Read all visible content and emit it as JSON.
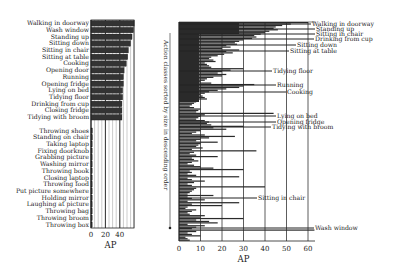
{
  "chart_data": [
    {
      "type": "bar",
      "orientation": "horizontal",
      "title": "",
      "xlabel": "AP",
      "ylabel": "",
      "xlim": [
        0,
        60
      ],
      "xticks": [
        0,
        20,
        40
      ],
      "grid": "vertical",
      "categories": [
        "Walking in doorway",
        "Wash window",
        "Standing up",
        "Sitting down",
        "Sitting in chair",
        "Sitting at table",
        "Cooking",
        "Opening door",
        "Running",
        "Opening fridge",
        "Lying on bed",
        "Tidying floor",
        "Drinking from cup",
        "Closing fridge",
        "Tidying with broom",
        "",
        "Throwing shoes",
        "Standing on chair",
        "Taking laptop",
        "Fixing doorknob",
        "Grabbing picture",
        "Washing mirror",
        "Throwing book",
        "Closing laptop",
        "Throwing food",
        "Put picture somewhere",
        "Holding mirror",
        "Laughing at picture",
        "Throwing bag",
        "Throwing broom",
        "Throwing box"
      ],
      "values": [
        60,
        59,
        57,
        55,
        52,
        51,
        49,
        46,
        45,
        45,
        44,
        44,
        43,
        43,
        43,
        null,
        2,
        2,
        1.5,
        1.5,
        1.2,
        1.2,
        1,
        1,
        1,
        0.8,
        0.8,
        0.7,
        0.6,
        0.5,
        0.5
      ]
    },
    {
      "type": "bar",
      "orientation": "horizontal",
      "title": "",
      "xlabel": "AP",
      "ylabel": "Action classes sorted by size in descending order",
      "xlim": [
        0,
        63
      ],
      "xticks": [
        0,
        10,
        20,
        30,
        40,
        50,
        60
      ],
      "grid": "vertical",
      "annotations": [
        {
          "label": "Walking in doorway",
          "value": 60
        },
        {
          "label": "Standing up",
          "value": 57
        },
        {
          "label": "Sitting in chair",
          "value": 52
        },
        {
          "label": "Drinking from cup",
          "value": 46
        },
        {
          "label": "Sitting down",
          "value": 40
        },
        {
          "label": "Sitting at table",
          "value": 36
        },
        {
          "label": "Tidying floor",
          "value": 40
        },
        {
          "label": "Running",
          "value": 44
        },
        {
          "label": "Cooking",
          "value": 48
        },
        {
          "label": "Lying on bed",
          "value": 35
        },
        {
          "label": "Opening fridge",
          "value": 38
        },
        {
          "label": "Tidying with broom",
          "value": 36
        },
        {
          "label": "Sitting in chair",
          "value": 28
        },
        {
          "label": "Wash window",
          "value": 63
        }
      ],
      "values": [
        60,
        52,
        48,
        45,
        44,
        46,
        42,
        40,
        38,
        35,
        36,
        34,
        30,
        28,
        26,
        27,
        22,
        24,
        20,
        28,
        22,
        25,
        21,
        18,
        15,
        14,
        16,
        17,
        12,
        13,
        14,
        15,
        30,
        24,
        20,
        18,
        22,
        20,
        16,
        13,
        12,
        10,
        15,
        35,
        30,
        28,
        22,
        18,
        14,
        12,
        10,
        11,
        12,
        13,
        9,
        8,
        7,
        6,
        5,
        7,
        10,
        9,
        8,
        44,
        12,
        10,
        9,
        8,
        12,
        14,
        13,
        15,
        30,
        16,
        22,
        10,
        8,
        6,
        12,
        26,
        14,
        10,
        8,
        18,
        10,
        9,
        8,
        11,
        6,
        36,
        7,
        5,
        8,
        18,
        6,
        7,
        9,
        6,
        4,
        7,
        10,
        16,
        30,
        5,
        6,
        4,
        8,
        28,
        4,
        6,
        12,
        7,
        4,
        6,
        40,
        8,
        7,
        6,
        5,
        4,
        16,
        4,
        6,
        12,
        4,
        28,
        6,
        20,
        4,
        3,
        8,
        6,
        4,
        5,
        12,
        10,
        30,
        8,
        14,
        18,
        4,
        12,
        8,
        6,
        63,
        8,
        4,
        6,
        10,
        3,
        4,
        5
      ]
    }
  ]
}
